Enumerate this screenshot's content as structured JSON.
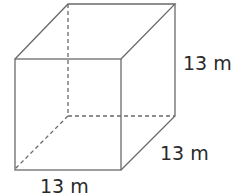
{
  "figure": {
    "shape": "cube",
    "labels": {
      "height": "13 m",
      "depth": "13 m",
      "width": "13 m"
    },
    "colors": {
      "edge": "#6a6a6a",
      "text": "#2a2a2a"
    }
  }
}
